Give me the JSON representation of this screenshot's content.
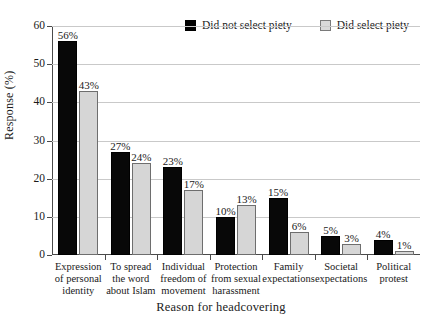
{
  "chart_data": {
    "type": "bar",
    "title": "",
    "xlabel": "Reason for headcovering",
    "ylabel": "Response (%)",
    "ylim": [
      0,
      60
    ],
    "ytick_step": 10,
    "yticks": [
      60,
      50,
      40,
      30,
      20,
      10,
      0
    ],
    "grid": "horizontal",
    "legend_position": "top-center",
    "categories": [
      "Expression of personal identity",
      "To spread the word about Islam",
      "Individual freedom of movement",
      "Protection from sexual harassment",
      "Family expectations",
      "Societal expectations",
      "Political protest"
    ],
    "category_lines": [
      [
        "Expression",
        "of personal",
        "identity"
      ],
      [
        "To spread",
        "the word",
        "about Islam"
      ],
      [
        "Individual",
        "freedom of",
        "movement"
      ],
      [
        "Protection",
        "from sexual",
        "harassment"
      ],
      [
        "Family",
        "expectations"
      ],
      [
        "Societal",
        "expectations"
      ],
      [
        "Political",
        "protest"
      ]
    ],
    "series": [
      {
        "name": "Did not select piety",
        "color": "#080808",
        "values": [
          56,
          27,
          23,
          10,
          15,
          5,
          4
        ],
        "labels": [
          "56%",
          "27%",
          "23%",
          "10%",
          "15%",
          "5%",
          "4%"
        ]
      },
      {
        "name": "Did select piety",
        "color": "#d6d6d6",
        "values": [
          43,
          24,
          17,
          13,
          6,
          3,
          1
        ],
        "labels": [
          "43%",
          "24%",
          "17%",
          "13%",
          "6%",
          "3%",
          "1%"
        ]
      }
    ]
  },
  "axis": {
    "y_title": "Response (%)",
    "x_title": "Reason for headcovering",
    "y_tick_labels": [
      "60",
      "50",
      "40",
      "30",
      "20",
      "10",
      "0"
    ]
  },
  "legend": {
    "items": [
      {
        "label": "Did not select piety",
        "swatch": "dark"
      },
      {
        "label": "Did select piety",
        "swatch": "light"
      }
    ]
  }
}
